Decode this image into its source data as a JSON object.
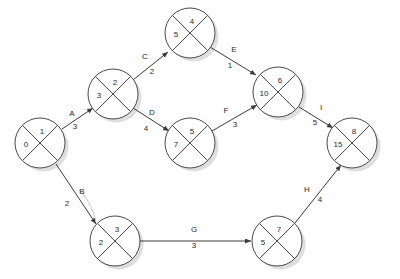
{
  "diagram": {
    "type": "network-diagram",
    "colors": {
      "background": "#ffffff",
      "node_stroke": "#4a4a4a",
      "node_fill": "#ffffff",
      "edge_stroke": "#3a3a3a",
      "shadow": "#d8d8d8",
      "text": "#2a2a2a"
    },
    "nodes": [
      {
        "key": "n1",
        "id_label": "1",
        "value_label": "0",
        "cx": 40,
        "cy": 143
      },
      {
        "key": "n2",
        "id_label": "2",
        "value_label": "3",
        "cx": 113,
        "cy": 94
      },
      {
        "key": "n3",
        "id_label": "3",
        "value_label": "2",
        "cx": 115,
        "cy": 241
      },
      {
        "key": "n4",
        "id_label": "4",
        "value_label": "5",
        "cx": 190,
        "cy": 33
      },
      {
        "key": "n5",
        "id_label": "5",
        "value_label": "7",
        "cx": 190,
        "cy": 143
      },
      {
        "key": "n6",
        "id_label": "6",
        "value_label": "10",
        "cx": 278,
        "cy": 92
      },
      {
        "key": "n7",
        "id_label": "7",
        "value_label": "5",
        "cx": 277,
        "cy": 241
      },
      {
        "key": "n8",
        "id_label": "8",
        "value_label": "15",
        "cx": 352,
        "cy": 143
      }
    ],
    "edges": [
      {
        "key": "e-a",
        "label": "A",
        "duration": "3",
        "from": "n1",
        "to": "n2",
        "x1": 62,
        "y1": 129,
        "x2": 93,
        "y2": 108,
        "lx": 72,
        "ly": 114,
        "dx": 75,
        "dy": 127
      },
      {
        "key": "e-b",
        "label": "B",
        "duration": "2",
        "from": "n1",
        "to": "n3",
        "x1": 56,
        "y1": 164,
        "x2": 96,
        "y2": 224,
        "lx": 82,
        "ly": 192,
        "dx": 67,
        "dy": 204
      },
      {
        "key": "e-c",
        "label": "C",
        "duration": "2",
        "from": "n2",
        "to": "n4",
        "x1": 133,
        "y1": 80,
        "x2": 168,
        "y2": 52,
        "lx": 145,
        "ly": 57,
        "dx": 152,
        "dy": 72
      },
      {
        "key": "e-d",
        "label": "D",
        "duration": "4",
        "from": "n2",
        "to": "n5",
        "x1": 133,
        "y1": 108,
        "x2": 169,
        "y2": 131,
        "lx": 152,
        "ly": 113,
        "dx": 146,
        "dy": 129
      },
      {
        "key": "e-e",
        "label": "E",
        "duration": "1",
        "from": "n4",
        "to": "n6",
        "x1": 210,
        "y1": 47,
        "x2": 256,
        "y2": 75,
        "lx": 234,
        "ly": 50,
        "dx": 230,
        "dy": 66
      },
      {
        "key": "e-f",
        "label": "F",
        "duration": "3",
        "from": "n5",
        "to": "n6",
        "x1": 212,
        "y1": 131,
        "x2": 257,
        "y2": 105,
        "lx": 226,
        "ly": 111,
        "dx": 235,
        "dy": 125
      },
      {
        "key": "e-g",
        "label": "G",
        "duration": "3",
        "from": "n3",
        "to": "n7",
        "x1": 139,
        "y1": 241,
        "x2": 251,
        "y2": 241,
        "lx": 194,
        "ly": 230,
        "dx": 194,
        "dy": 246
      },
      {
        "key": "e-h",
        "label": "H",
        "duration": "4",
        "from": "n7",
        "to": "n8",
        "x1": 295,
        "y1": 223,
        "x2": 341,
        "y2": 165,
        "lx": 307,
        "ly": 190,
        "dx": 320,
        "dy": 200
      },
      {
        "key": "e-i",
        "label": "I",
        "duration": "5",
        "from": "n6",
        "to": "n8",
        "x1": 299,
        "y1": 107,
        "x2": 333,
        "y2": 128,
        "lx": 321,
        "ly": 108,
        "dx": 315,
        "dy": 123
      }
    ],
    "annotations": {
      "b_curve_note": "faint grey leader curve beside activity B"
    }
  }
}
